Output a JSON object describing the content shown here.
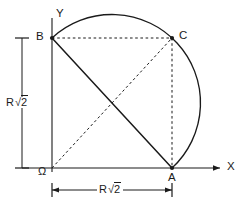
{
  "figure": {
    "background_color": "#ffffff",
    "stroke_color": "#1a1a1a",
    "axes": {
      "x_label": "X",
      "y_label": "Y",
      "origin_label": "Ω"
    },
    "points": [
      {
        "id": "A",
        "label": "A",
        "x": 172,
        "y": 168
      },
      {
        "id": "B",
        "label": "B",
        "x": 52,
        "y": 38
      },
      {
        "id": "C",
        "label": "C",
        "x": 172,
        "y": 38
      }
    ],
    "dimensions": {
      "vertical": {
        "label_prefix": "R",
        "label_radical": "2",
        "value": "R√2"
      },
      "horizontal": {
        "label_prefix": "R",
        "label_radical": "2",
        "value": "R√2"
      }
    },
    "elements": {
      "arc_label": "circular arc from B over apex to A",
      "solid_chord_label": "segment B to A",
      "dashed_top_label": "segment B to C",
      "dashed_right_label": "segment C to A",
      "dashed_diagonal_label": "segment Ω to C"
    }
  }
}
